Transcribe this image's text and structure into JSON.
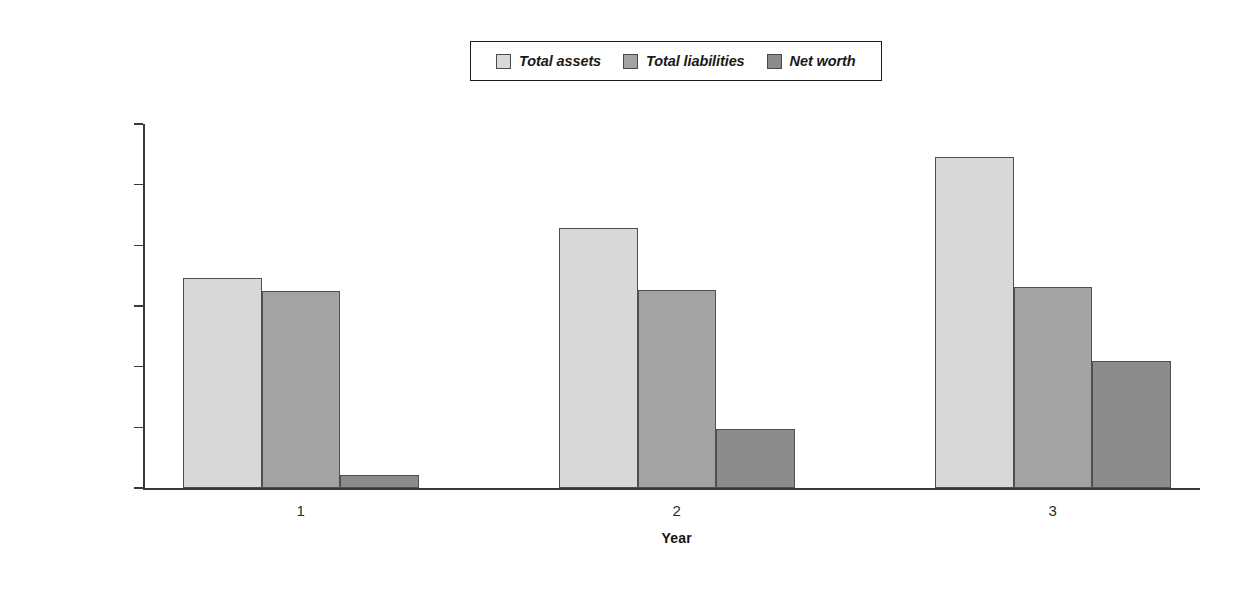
{
  "chart_data": {
    "type": "bar",
    "title": "",
    "subtitle": "",
    "xlabel": "Year",
    "ylabel": "",
    "categories": [
      "1",
      "2",
      "3"
    ],
    "series": [
      {
        "name": "Total assets",
        "values": [
          173000,
          214000,
          273000
        ],
        "color": "#d9d9d9"
      },
      {
        "name": "Total liabilities",
        "values": [
          162000,
          163000,
          166000
        ],
        "color": "#a3a3a3"
      },
      {
        "name": "Net worth",
        "values": [
          11000,
          49000,
          105000
        ],
        "color": "#8b8b8b"
      }
    ],
    "ylim": [
      0,
      300000
    ],
    "ytick_values": [
      0,
      50000,
      100000,
      150000,
      200000,
      250000,
      300000
    ],
    "ytick_labels": [
      "$0",
      "$50,000",
      "$100,000",
      "$150,000",
      "$200,000",
      "$250,000",
      "$300,000"
    ],
    "grid": false,
    "legend_position": "top-center",
    "bar_border_color": "#4f4f4f",
    "axis_color": "#3a3a3a",
    "text_color": "#2b2b2b"
  },
  "legend": {
    "entries": [
      {
        "label": "Total assets"
      },
      {
        "label": "Total liabilities"
      },
      {
        "label": "Net worth"
      }
    ]
  },
  "axes": {
    "x_title": "Year",
    "x_labels": [
      "1",
      "2",
      "3"
    ],
    "y_labels": [
      "$300,000",
      "$250,000",
      "$200,000",
      "$150,000",
      "$100,000",
      "$50,000",
      "$0"
    ]
  }
}
